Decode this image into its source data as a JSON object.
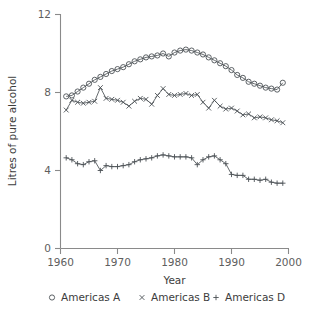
{
  "chart_data": {
    "type": "line",
    "title": "",
    "xlabel": "Year",
    "ylabel": "Litres of pure alcohol",
    "xlim": [
      1960,
      2000
    ],
    "ylim": [
      0,
      12
    ],
    "xticks": [
      1960,
      1970,
      1980,
      1990,
      2000
    ],
    "yticks": [
      0,
      4,
      8,
      12
    ],
    "grid": false,
    "legend_position": "below",
    "x": [
      1961,
      1962,
      1963,
      1964,
      1965,
      1966,
      1967,
      1968,
      1969,
      1970,
      1971,
      1972,
      1973,
      1974,
      1975,
      1976,
      1977,
      1978,
      1979,
      1980,
      1981,
      1982,
      1983,
      1984,
      1985,
      1986,
      1987,
      1988,
      1989,
      1990,
      1991,
      1992,
      1993,
      1994,
      1995,
      1996,
      1997,
      1998,
      1999
    ],
    "series": [
      {
        "name": "Americas A",
        "marker": "circle",
        "values": [
          7.8,
          7.85,
          8.05,
          8.25,
          8.45,
          8.65,
          8.8,
          8.95,
          9.1,
          9.2,
          9.3,
          9.45,
          9.6,
          9.7,
          9.8,
          9.85,
          9.9,
          10.0,
          9.85,
          10.05,
          10.15,
          10.2,
          10.15,
          10.05,
          9.95,
          9.8,
          9.65,
          9.5,
          9.35,
          9.15,
          8.9,
          8.75,
          8.55,
          8.45,
          8.35,
          8.25,
          8.2,
          8.15,
          8.5
        ]
      },
      {
        "name": "Americas B",
        "marker": "cross",
        "values": [
          7.1,
          7.6,
          7.5,
          7.45,
          7.5,
          7.55,
          8.25,
          7.7,
          7.65,
          7.6,
          7.5,
          7.3,
          7.55,
          7.7,
          7.65,
          7.4,
          7.85,
          8.2,
          7.9,
          7.85,
          7.9,
          7.95,
          7.85,
          7.9,
          7.5,
          7.2,
          7.6,
          7.3,
          7.15,
          7.2,
          7.05,
          6.85,
          6.9,
          6.7,
          6.75,
          6.7,
          6.6,
          6.55,
          6.45
        ]
      },
      {
        "name": "Americas D",
        "marker": "plus",
        "values": [
          4.65,
          4.55,
          4.35,
          4.3,
          4.45,
          4.5,
          4.0,
          4.25,
          4.2,
          4.2,
          4.25,
          4.3,
          4.45,
          4.55,
          4.6,
          4.65,
          4.75,
          4.8,
          4.75,
          4.7,
          4.7,
          4.7,
          4.65,
          4.3,
          4.55,
          4.7,
          4.75,
          4.55,
          4.35,
          3.8,
          3.75,
          3.75,
          3.55,
          3.55,
          3.5,
          3.55,
          3.4,
          3.35,
          3.35
        ]
      }
    ]
  },
  "legend": {
    "entries": [
      {
        "marker": "circle",
        "label": "Americas A"
      },
      {
        "marker": "cross",
        "label": "Americas B"
      },
      {
        "marker": "plus",
        "label": "Americas D"
      }
    ]
  },
  "colors": {
    "axis": "#8a8a8a",
    "tick_text": "#5e5e5e",
    "series": "#555a5e",
    "background": "#ffffff"
  },
  "axis_labels": {
    "y_title": "Litres of pure alcohol",
    "x_title": "Year",
    "y_tick_0": "0",
    "y_tick_4": "4",
    "y_tick_8": "8",
    "y_tick_12": "12",
    "x_tick_1960": "1960",
    "x_tick_1970": "1970",
    "x_tick_1980": "1980",
    "x_tick_1990": "1990",
    "x_tick_2000": "2000"
  }
}
